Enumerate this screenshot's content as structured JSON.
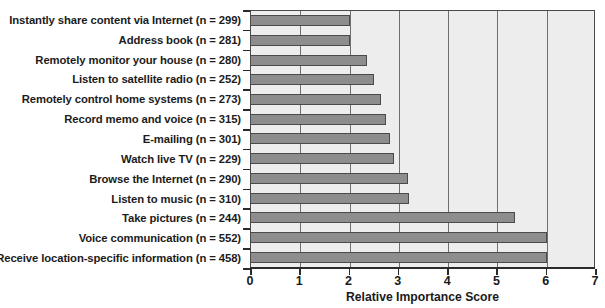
{
  "chart_data": {
    "type": "bar",
    "orientation": "horizontal",
    "title": "",
    "xlabel": "Relative Importance Score",
    "ylabel": "",
    "xlim": [
      0,
      7
    ],
    "xticks": [
      "0",
      "1",
      "2",
      "3",
      "4",
      "5",
      "6",
      "7"
    ],
    "grid": true,
    "legend": false,
    "bar_color": "#8d8d8d",
    "plot_background": "#ededed",
    "axis_color": "#2a2a2a",
    "categories": [
      "Instantly share content via Internet (n = 299)",
      "Address book (n = 281)",
      "Remotely monitor your house (n = 280)",
      "Listen to satellite radio (n = 252)",
      "Remotely control home systems (n = 273)",
      "Record memo and voice (n = 315)",
      "E-mailing (n = 301)",
      "Watch live TV (n = 229)",
      "Browse the Internet (n = 290)",
      "Listen to music (n = 310)",
      "Take pictures (n = 244)",
      "Voice communication (n = 552)",
      "Receive location-specific information (n = 458)"
    ],
    "values": [
      2.0,
      2.0,
      2.35,
      2.5,
      2.63,
      2.73,
      2.83,
      2.9,
      3.18,
      3.2,
      5.35,
      6.0,
      6.0
    ]
  }
}
